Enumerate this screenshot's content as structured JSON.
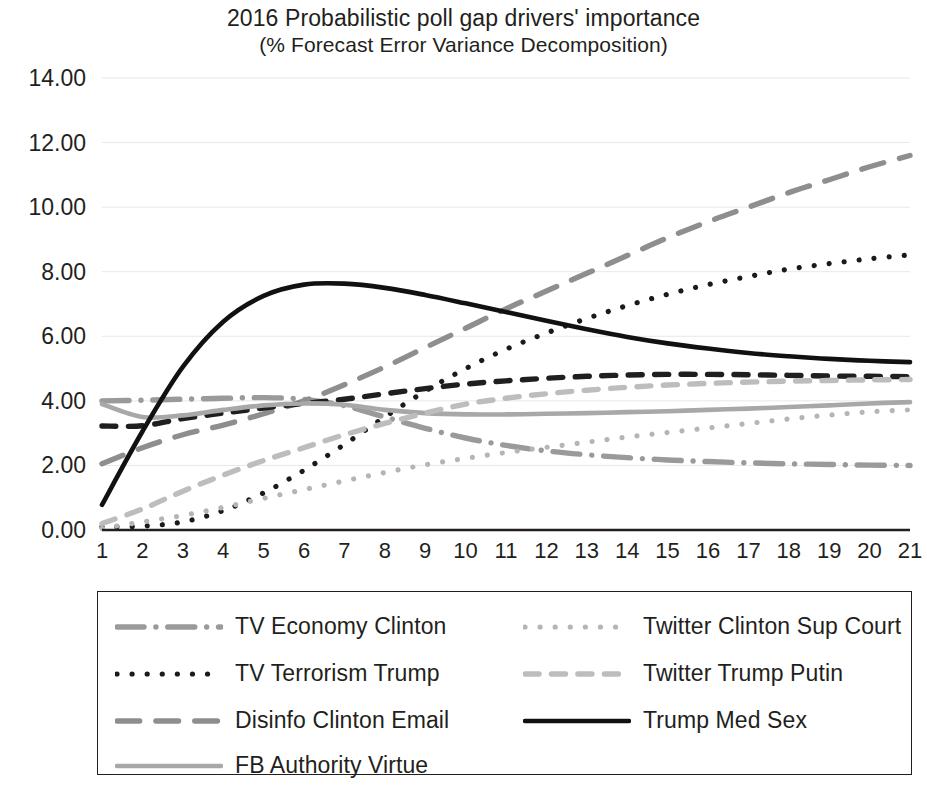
{
  "title": {
    "line1": "2016 Probabilistic poll gap drivers' importance",
    "line2": "(% Forecast Error Variance Decomposition)"
  },
  "axes": {
    "y_ticks": [
      "0.00",
      "2.00",
      "4.00",
      "6.00",
      "8.00",
      "10.00",
      "12.00",
      "14.00"
    ],
    "x_ticks": [
      "1",
      "2",
      "3",
      "4",
      "5",
      "6",
      "7",
      "8",
      "9",
      "10",
      "11",
      "12",
      "13",
      "14",
      "15",
      "16",
      "17",
      "18",
      "19",
      "20",
      "21"
    ]
  },
  "legend": {
    "items": [
      {
        "label": "TV Economy Clinton",
        "style": "dash-dot",
        "color": "#9a9a9a"
      },
      {
        "label": "Twitter Clinton Sup Court",
        "style": "dotted",
        "color": "#b5b5b5"
      },
      {
        "label": "TV Terrorism Trump",
        "style": "dotted",
        "color": "#1a1a1a"
      },
      {
        "label": "Twitter Trump Putin",
        "style": "dashed",
        "color": "#bdbdbd"
      },
      {
        "label": "Disinfo Clinton Email",
        "style": "long-dash",
        "color": "#8e8e8e"
      },
      {
        "label": "Trump Med Sex",
        "style": "solid",
        "color": "#111111"
      },
      {
        "label": "FB Authority Virtue",
        "style": "solid",
        "color": "#a8a8a8"
      }
    ]
  },
  "chart_data": {
    "type": "line",
    "title": "2016 Probabilistic poll gap drivers' importance (% Forecast Error Variance Decomposition)",
    "xlabel": "",
    "ylabel": "",
    "xlim": [
      1,
      21
    ],
    "ylim": [
      0,
      14
    ],
    "grid": true,
    "legend_position": "bottom",
    "x": [
      1,
      2,
      3,
      4,
      5,
      6,
      7,
      8,
      9,
      10,
      11,
      12,
      13,
      14,
      15,
      16,
      17,
      18,
      19,
      20,
      21
    ],
    "series": [
      {
        "name": "TV Economy Clinton",
        "style": "dash-dot",
        "color": "#9a9a9a",
        "values": [
          4.0,
          4.02,
          4.05,
          4.08,
          4.1,
          4.05,
          3.85,
          3.5,
          3.15,
          2.85,
          2.62,
          2.45,
          2.33,
          2.24,
          2.17,
          2.12,
          2.08,
          2.05,
          2.03,
          2.01,
          2.0
        ]
      },
      {
        "name": "TV Terrorism Trump",
        "style": "dotted",
        "color": "#1a1a1a",
        "values": [
          0.1,
          0.12,
          0.25,
          0.6,
          1.15,
          1.85,
          2.65,
          3.5,
          4.3,
          5.0,
          5.6,
          6.1,
          6.55,
          6.95,
          7.3,
          7.6,
          7.85,
          8.08,
          8.25,
          8.4,
          8.52
        ]
      },
      {
        "name": "Disinfo Clinton Email",
        "style": "long-dash",
        "color": "#8e8e8e",
        "values": [
          2.05,
          2.55,
          2.95,
          3.25,
          3.6,
          4.0,
          4.5,
          5.05,
          5.65,
          6.25,
          6.85,
          7.4,
          7.95,
          8.5,
          9.05,
          9.55,
          10.0,
          10.45,
          10.85,
          11.25,
          11.6
        ]
      },
      {
        "name": "Disinfo Clinton Email (dark)",
        "style": "dashed",
        "color": "#1f1f1f",
        "values": [
          3.22,
          3.23,
          3.45,
          3.62,
          3.78,
          3.92,
          4.05,
          4.22,
          4.38,
          4.52,
          4.62,
          4.7,
          4.76,
          4.8,
          4.82,
          4.82,
          4.81,
          4.79,
          4.77,
          4.76,
          4.75
        ]
      },
      {
        "name": "FB Authority Virtue",
        "style": "solid",
        "color": "#a8a8a8",
        "values": [
          3.9,
          3.5,
          3.55,
          3.72,
          3.86,
          3.92,
          3.88,
          3.72,
          3.62,
          3.58,
          3.58,
          3.6,
          3.62,
          3.65,
          3.68,
          3.72,
          3.76,
          3.81,
          3.86,
          3.92,
          3.96
        ]
      },
      {
        "name": "Twitter Clinton Sup Court",
        "style": "dotted",
        "color": "#b5b5b5",
        "values": [
          0.05,
          0.25,
          0.45,
          0.7,
          0.98,
          1.25,
          1.52,
          1.78,
          2.02,
          2.22,
          2.4,
          2.56,
          2.72,
          2.88,
          3.02,
          3.16,
          3.3,
          3.44,
          3.56,
          3.66,
          3.72
        ]
      },
      {
        "name": "Twitter Trump Putin",
        "style": "dashed",
        "color": "#bdbdbd",
        "values": [
          0.2,
          0.65,
          1.2,
          1.7,
          2.15,
          2.55,
          2.95,
          3.3,
          3.62,
          3.9,
          4.08,
          4.22,
          4.33,
          4.42,
          4.49,
          4.54,
          4.58,
          4.61,
          4.63,
          4.65,
          4.66
        ]
      },
      {
        "name": "Trump Med Sex",
        "style": "solid",
        "color": "#111111",
        "values": [
          0.78,
          3.05,
          5.05,
          6.45,
          7.25,
          7.6,
          7.63,
          7.5,
          7.28,
          7.02,
          6.75,
          6.48,
          6.22,
          5.98,
          5.78,
          5.62,
          5.48,
          5.38,
          5.3,
          5.24,
          5.2
        ]
      }
    ]
  }
}
